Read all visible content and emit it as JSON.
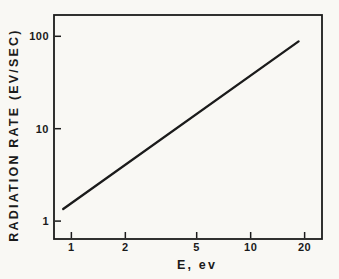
{
  "figure": {
    "background": "#f9f8f4",
    "ink": "#1b1b1b"
  },
  "chart_data": {
    "type": "line",
    "xlabel": "E, ev",
    "ylabel": "RADIATION RATE (EV/SEC)",
    "x_scale": "log",
    "y_scale": "log",
    "xlim": [
      0.8,
      25
    ],
    "ylim": [
      0.64,
      170
    ],
    "grid": false,
    "legend": "none",
    "frame": "full-box",
    "x_ticks": [
      {
        "value": 1,
        "label": "1"
      },
      {
        "value": 2,
        "label": "2"
      },
      {
        "value": 5,
        "label": "5"
      },
      {
        "value": 10,
        "label": "10"
      },
      {
        "value": 20,
        "label": "20"
      }
    ],
    "y_ticks": [
      {
        "value": 1,
        "label": "1"
      },
      {
        "value": 10,
        "label": "10"
      },
      {
        "value": 100,
        "label": "100"
      }
    ],
    "series": [
      {
        "name": "radiation rate vs electron energy",
        "points": [
          [
            0.9,
            1.35
          ],
          [
            18.5,
            88
          ]
        ]
      }
    ]
  }
}
